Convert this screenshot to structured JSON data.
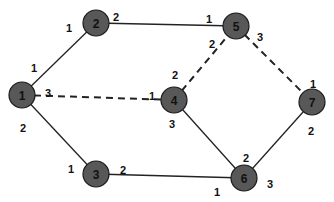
{
  "diagram": {
    "type": "network-graph",
    "colors": {
      "node_fill": "#585858",
      "node_stroke": "#1a1a1a",
      "edge": "#222222",
      "text": "#111111",
      "background": "#ffffff"
    },
    "nodes": [
      {
        "id": "1",
        "label": "1",
        "x": 22,
        "y": 95
      },
      {
        "id": "2",
        "label": "2",
        "x": 96,
        "y": 23
      },
      {
        "id": "3",
        "label": "3",
        "x": 96,
        "y": 174
      },
      {
        "id": "4",
        "label": "4",
        "x": 174,
        "y": 100
      },
      {
        "id": "5",
        "label": "5",
        "x": 236,
        "y": 26
      },
      {
        "id": "6",
        "label": "6",
        "x": 244,
        "y": 178
      },
      {
        "id": "7",
        "label": "7",
        "x": 312,
        "y": 102
      }
    ],
    "edges": [
      {
        "from": "1",
        "to": "2",
        "style": "solid",
        "from_port": "1",
        "to_port": "1"
      },
      {
        "from": "2",
        "to": "5",
        "style": "solid",
        "from_port": "2",
        "to_port": "1"
      },
      {
        "from": "1",
        "to": "4",
        "style": "dashed",
        "from_port": "3",
        "to_port": "1"
      },
      {
        "from": "4",
        "to": "5",
        "style": "dashed",
        "from_port": "2",
        "to_port": "2"
      },
      {
        "from": "5",
        "to": "7",
        "style": "dashed",
        "from_port": "3",
        "to_port": "1"
      },
      {
        "from": "1",
        "to": "3",
        "style": "solid",
        "from_port": "2",
        "to_port": "1"
      },
      {
        "from": "3",
        "to": "6",
        "style": "solid",
        "from_port": "2",
        "to_port": "1"
      },
      {
        "from": "4",
        "to": "6",
        "style": "solid",
        "from_port": "3",
        "to_port": "2"
      },
      {
        "from": "6",
        "to": "7",
        "style": "solid",
        "from_port": "3",
        "to_port": "2"
      }
    ],
    "port_labels": [
      {
        "text": "1",
        "x": 34,
        "y": 68
      },
      {
        "text": "1",
        "x": 69,
        "y": 28
      },
      {
        "text": "2",
        "x": 116,
        "y": 17
      },
      {
        "text": "1",
        "x": 209,
        "y": 19
      },
      {
        "text": "3",
        "x": 48,
        "y": 93
      },
      {
        "text": "1",
        "x": 152,
        "y": 96
      },
      {
        "text": "2",
        "x": 175,
        "y": 75
      },
      {
        "text": "2",
        "x": 212,
        "y": 44
      },
      {
        "text": "3",
        "x": 260,
        "y": 37
      },
      {
        "text": "1",
        "x": 313,
        "y": 84
      },
      {
        "text": "2",
        "x": 23,
        "y": 128
      },
      {
        "text": "1",
        "x": 71,
        "y": 169
      },
      {
        "text": "2",
        "x": 123,
        "y": 170
      },
      {
        "text": "3",
        "x": 172,
        "y": 124
      },
      {
        "text": "2",
        "x": 246,
        "y": 158
      },
      {
        "text": "1",
        "x": 217,
        "y": 192
      },
      {
        "text": "3",
        "x": 270,
        "y": 184
      },
      {
        "text": "2",
        "x": 311,
        "y": 131
      }
    ]
  }
}
